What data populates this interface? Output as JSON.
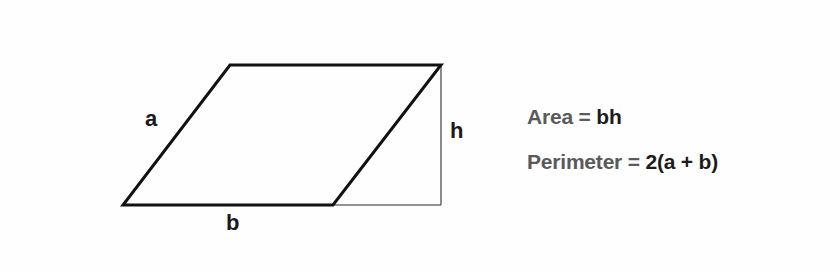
{
  "diagram": {
    "labels": {
      "side": "a",
      "base": "b",
      "height": "h"
    },
    "vertices": {
      "top_left": [
        230,
        65
      ],
      "top_right": [
        441,
        65
      ],
      "bottom_right": [
        333,
        205
      ],
      "bottom_left": [
        123,
        205
      ]
    },
    "height_guide": {
      "x": 441,
      "y_top": 65,
      "y_bottom": 205,
      "base_extension_from_x": 333
    },
    "colors": {
      "outline": "#111111",
      "guide": "#6e6e6e",
      "formula_name": "#5a5a5a",
      "formula_expr": "#1c1c1c"
    }
  },
  "formulas": [
    {
      "name": "Area",
      "eq": "=",
      "expr": "bh"
    },
    {
      "name": "Perimeter",
      "eq": "=",
      "expr": "2(a + b)"
    }
  ]
}
